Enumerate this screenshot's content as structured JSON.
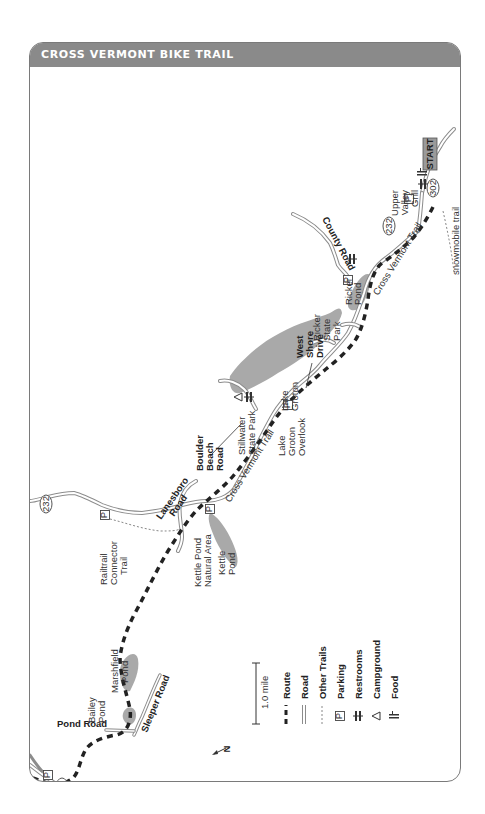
{
  "header": {
    "title": "CROSS VERMONT BIKE TRAIL"
  },
  "colors": {
    "header_bg": "#8a8a8a",
    "water": "#a9a9a9",
    "route": "#222222",
    "road": "#8c8c8c"
  },
  "map": {
    "orientation_note": "North arrow points left",
    "labels": {
      "start": "START",
      "upper_valley_grill": [
        "Upper",
        "Valley",
        "Grill"
      ],
      "route_302": "302",
      "route_232_east": "232",
      "route_232_west": "232",
      "route_2": "2",
      "cross_vermont_trail_east": "Cross Vermont Trail",
      "cross_vermont_trail_mid": "Cross Vermont Trail",
      "snowmobile_trail": "snowmobile trail",
      "county_road": "County Road",
      "ricker_pond": [
        "Ricker",
        "Pond"
      ],
      "ricker_state_park": [
        "Ricker",
        "State",
        "Park"
      ],
      "west_shore_drive": [
        "West",
        "Shore",
        "Drive"
      ],
      "lake_groton": [
        "Lake",
        "Groton"
      ],
      "lake_groton_overlook": [
        "Lake",
        "Groton",
        "Overlook"
      ],
      "stillwater_state_park": [
        "Stillwater",
        "State Park"
      ],
      "boulder_beach_road": [
        "Boulder",
        "Beach",
        "Road"
      ],
      "lanesboro_road": [
        "Lanesboro",
        "Road"
      ],
      "railtrail_connector_trail": [
        "Railtrail",
        "Connector",
        "Trail"
      ],
      "kettle_pond_natural_area": [
        "Kettle Pond",
        "Natural Area"
      ],
      "kettle_pond": [
        "Kettle",
        "Pond"
      ],
      "marshfield_pond": [
        "Marshfield",
        "Pond"
      ],
      "bailey_pond": [
        "Bailey",
        "Pond"
      ],
      "pond_road": "Pond Road",
      "sleeper_road": "Sleeper Road",
      "parking_glyph": "P"
    }
  },
  "scale": {
    "label": "1.0 mile",
    "north_label": "N"
  },
  "legend": [
    {
      "icon": "route-line",
      "label": "Route"
    },
    {
      "icon": "road-line",
      "label": "Road"
    },
    {
      "icon": "other-trails-line",
      "label": "Other Trails"
    },
    {
      "icon": "parking-icon",
      "label": "Parking"
    },
    {
      "icon": "restrooms-icon",
      "label": "Restrooms"
    },
    {
      "icon": "campground-icon",
      "label": "Campground"
    },
    {
      "icon": "food-icon",
      "label": "Food"
    }
  ]
}
